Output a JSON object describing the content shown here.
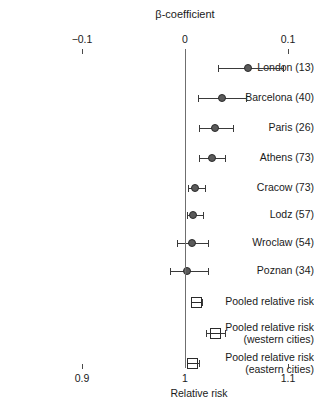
{
  "figure": {
    "type": "forest-plot",
    "top_axis": {
      "title": "β-coefficient",
      "ticks": [
        {
          "label": "−0.1",
          "value": -0.1
        },
        {
          "label": "0",
          "value": 0
        },
        {
          "label": "0.1",
          "value": 0.1
        }
      ]
    },
    "bottom_axis": {
      "title": "Relative risk",
      "ticks": [
        {
          "label": "0.9",
          "value": 0.9
        },
        {
          "label": "1",
          "value": 1.0
        },
        {
          "label": "1.1",
          "value": 1.1
        }
      ]
    },
    "reference_line": {
      "value": 0,
      "label": "no-effect-line"
    }
  },
  "chart_data": {
    "type": "scatter",
    "title": "β-coefficient",
    "xlabel": "Relative risk",
    "ylabel": "",
    "xlim": [
      -0.105,
      0.105
    ],
    "grid": false,
    "legend": "none",
    "rows": [
      {
        "label": "London (13)",
        "marker": "circle",
        "beta": 0.0615,
        "ci_low": 0.032,
        "ci_high": 0.095
      },
      {
        "label": "Barcelona (40)",
        "marker": "circle",
        "beta": 0.036,
        "ci_low": 0.0125,
        "ci_high": 0.059
      },
      {
        "label": "Paris (26)",
        "marker": "circle",
        "beta": 0.029,
        "ci_low": 0.0135,
        "ci_high": 0.0465
      },
      {
        "label": "Athens (73)",
        "marker": "circle",
        "beta": 0.026,
        "ci_low": 0.0135,
        "ci_high": 0.0385
      },
      {
        "label": "Cracow (73)",
        "marker": "circle",
        "beta": 0.01,
        "ci_low": 0.003,
        "ci_high": 0.0195
      },
      {
        "label": "Lodz (57)",
        "marker": "circle",
        "beta": 0.008,
        "ci_low": 0.002,
        "ci_high": 0.0175
      },
      {
        "label": "Wroclaw (54)",
        "marker": "circle",
        "beta": 0.007,
        "ci_low": -0.0075,
        "ci_high": 0.0225
      },
      {
        "label": "Poznan (34)",
        "marker": "circle",
        "beta": 0.002,
        "ci_low": -0.015,
        "ci_high": 0.0225
      },
      {
        "label": "Pooled relative risk",
        "marker": "square",
        "beta": 0.0115,
        "ci_low": 0.0065,
        "ci_high": 0.0165
      },
      {
        "label": "Pooled relative risk\n(western cities)",
        "marker": "square",
        "beta": 0.03,
        "ci_low": 0.0205,
        "ci_high": 0.0385
      },
      {
        "label": "Pooled relative risk\n(eastern cities)",
        "marker": "square",
        "beta": 0.0075,
        "ci_low": 0.0015,
        "ci_high": 0.0135
      }
    ]
  },
  "colors": {
    "marker_fill": "#5a5a5a",
    "marker_edge": "#2b2b2b",
    "line": "#3a3a3a",
    "reference": "#6f6f6f",
    "background": "#ffffff",
    "text": "#1a1a1a"
  }
}
